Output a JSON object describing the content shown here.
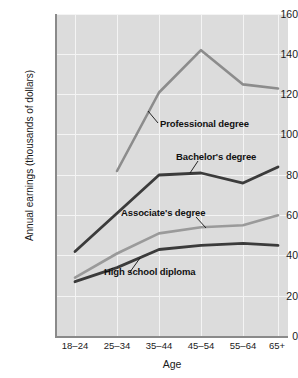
{
  "chart_data": {
    "type": "line",
    "title": "",
    "xlabel": "Age",
    "ylabel": "Annual earnings (thousands of dollars)",
    "categories": [
      "18–24",
      "25–34",
      "35–44",
      "45–54",
      "55–64",
      "65+"
    ],
    "x_ticks": [
      "18–24",
      "25–34",
      "35–44",
      "45–54",
      "55–64",
      "65+"
    ],
    "y_ticks": [
      0,
      20,
      40,
      60,
      80,
      100,
      120,
      140,
      160
    ],
    "ylim": [
      0,
      160
    ],
    "grid": true,
    "legend": "inline-annotations",
    "series": [
      {
        "name": "Professional degree",
        "color": "#8c8c8c",
        "values": [
          null,
          82,
          121,
          142,
          125,
          123
        ]
      },
      {
        "name": "Bachelor's degree",
        "color": "#3b3b3b",
        "values": [
          42,
          61,
          80,
          81,
          76,
          84
        ]
      },
      {
        "name": "Associate's degree",
        "color": "#9a9a9a",
        "values": [
          29,
          41,
          51,
          54,
          55,
          60
        ]
      },
      {
        "name": "High school diploma",
        "color": "#3b3b3b",
        "values": [
          27,
          34,
          43,
          45,
          46,
          45
        ]
      }
    ],
    "annotations": [
      {
        "text": "Professional degree",
        "series": "Professional degree"
      },
      {
        "text": "Bachelor's degree",
        "series": "Bachelor's degree"
      },
      {
        "text": "Associate's degree",
        "series": "Associate's degree"
      },
      {
        "text": "High school diploma",
        "series": "High school diploma"
      }
    ],
    "colors": {
      "plot_background": "#dcdcdc",
      "gridline": "#f4f4f4",
      "axis": "#8a8a8a",
      "dark_series": "#3b3b3b",
      "light_series": "#9a9a9a",
      "page_background": "#ffffff"
    }
  }
}
